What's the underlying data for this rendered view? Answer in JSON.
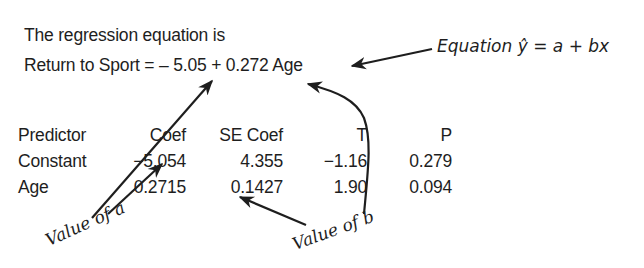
{
  "header": {
    "line1": "The regression equation is",
    "line2": "Return to Sport = – 5.05 + 0.272 Age"
  },
  "annotations": {
    "equation_label": "Equation ŷ = a + bx",
    "value_of_a": "Value of a",
    "value_of_b": "Value of b"
  },
  "table": {
    "columns": [
      "Predictor",
      "Coef",
      "SE Coef",
      "T",
      "P"
    ],
    "rows": [
      {
        "predictor": "Constant",
        "coef": "−5.054",
        "se_coef": "4.355",
        "t": "−1.16",
        "p": "0.279"
      },
      {
        "predictor": "Age",
        "coef": "0.2715",
        "se_coef": "0.1427",
        "t": "1.90",
        "p": "0.094"
      }
    ]
  },
  "colors": {
    "text": "#1e1e1e",
    "background": "#ffffff"
  }
}
